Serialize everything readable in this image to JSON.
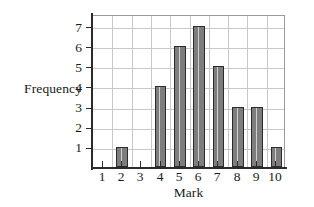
{
  "chart_data": {
    "type": "bar",
    "title": "",
    "xlabel": "Mark",
    "ylabel": "Frequency",
    "categories": [
      "1",
      "2",
      "3",
      "4",
      "5",
      "6",
      "7",
      "8",
      "9",
      "10"
    ],
    "values": [
      0,
      1,
      0,
      4,
      6,
      7,
      5,
      3,
      3,
      1
    ],
    "ylim": [
      0,
      7.6
    ],
    "y_ticks": [
      "1",
      "2",
      "3",
      "4",
      "5",
      "6",
      "7"
    ],
    "y_tick_values": [
      1,
      2,
      3,
      4,
      5,
      6,
      7
    ],
    "x_ticks": [
      "1",
      "2",
      "3",
      "4",
      "5",
      "6",
      "7",
      "8",
      "9",
      "10"
    ],
    "grid": true,
    "legend": false,
    "bar_fill_color": "#7d7d7d",
    "bar_highlight_color": "#cfcfcf",
    "bar_border_color": "#2b2b2b",
    "gridline_color": "#c8c8c8",
    "axis_color": "#2b2b2b",
    "background_color": "#ffffff"
  }
}
